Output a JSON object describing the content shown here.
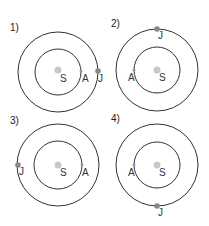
{
  "diagrams": [
    {
      "label": "1)",
      "sun": "S",
      "a": "A",
      "j": "J"
    },
    {
      "label": "2)",
      "sun": "S",
      "a": "A",
      "j": "J"
    },
    {
      "label": "3)",
      "sun": "S",
      "a": "A",
      "j": "J"
    },
    {
      "label": "4)",
      "sun": "S",
      "a": "A",
      "j": "J"
    }
  ],
  "colors": {
    "orbit": "#333333",
    "sun": "#c8c8c8",
    "planet_j": "#888888",
    "planet_a": "#999999"
  }
}
